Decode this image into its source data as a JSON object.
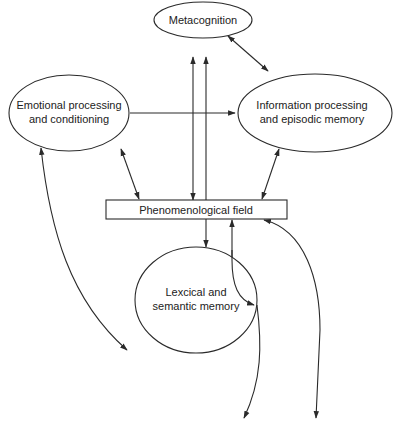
{
  "diagram": {
    "nodes": {
      "metacognition": {
        "label_lines": [
          "Metacognition"
        ],
        "shape": "ellipse"
      },
      "emotional": {
        "label_lines": [
          "Emotional processing",
          "and conditioning"
        ],
        "shape": "ellipse"
      },
      "information": {
        "label_lines": [
          "Information processing",
          "and episodic memory"
        ],
        "shape": "ellipse"
      },
      "phenomenological": {
        "label_lines": [
          "Phenomenological field"
        ],
        "shape": "rectangle"
      },
      "lexical": {
        "label_lines": [
          "Lexcical and",
          "semantic memory"
        ],
        "shape": "ellipse"
      }
    },
    "edges": [
      {
        "from": "metacognition",
        "to": "information",
        "direction": "bidirectional"
      },
      {
        "from": "metacognition",
        "to": "phenomenological",
        "direction": "forward"
      },
      {
        "from": "phenomenological",
        "to": "metacognition",
        "direction": "forward"
      },
      {
        "from": "emotional",
        "to": "information",
        "direction": "forward"
      },
      {
        "from": "emotional",
        "to": "phenomenological",
        "direction": "bidirectional"
      },
      {
        "from": "information",
        "to": "phenomenological",
        "direction": "bidirectional"
      },
      {
        "from": "phenomenological",
        "to": "lexical",
        "direction": "forward"
      },
      {
        "from": "lexical",
        "to": "phenomenological",
        "direction": "forward"
      },
      {
        "from": "emotional",
        "to": "external-lower-left",
        "direction": "bidirectional"
      },
      {
        "from": "phenomenological",
        "to": "external-bottom-right",
        "direction": "bidirectional"
      },
      {
        "from": "lexical",
        "to": "external-bottom-center",
        "direction": "forward"
      }
    ],
    "colors": {
      "stroke": "#2a2a2a",
      "text": "#222222",
      "background": "#ffffff"
    }
  }
}
